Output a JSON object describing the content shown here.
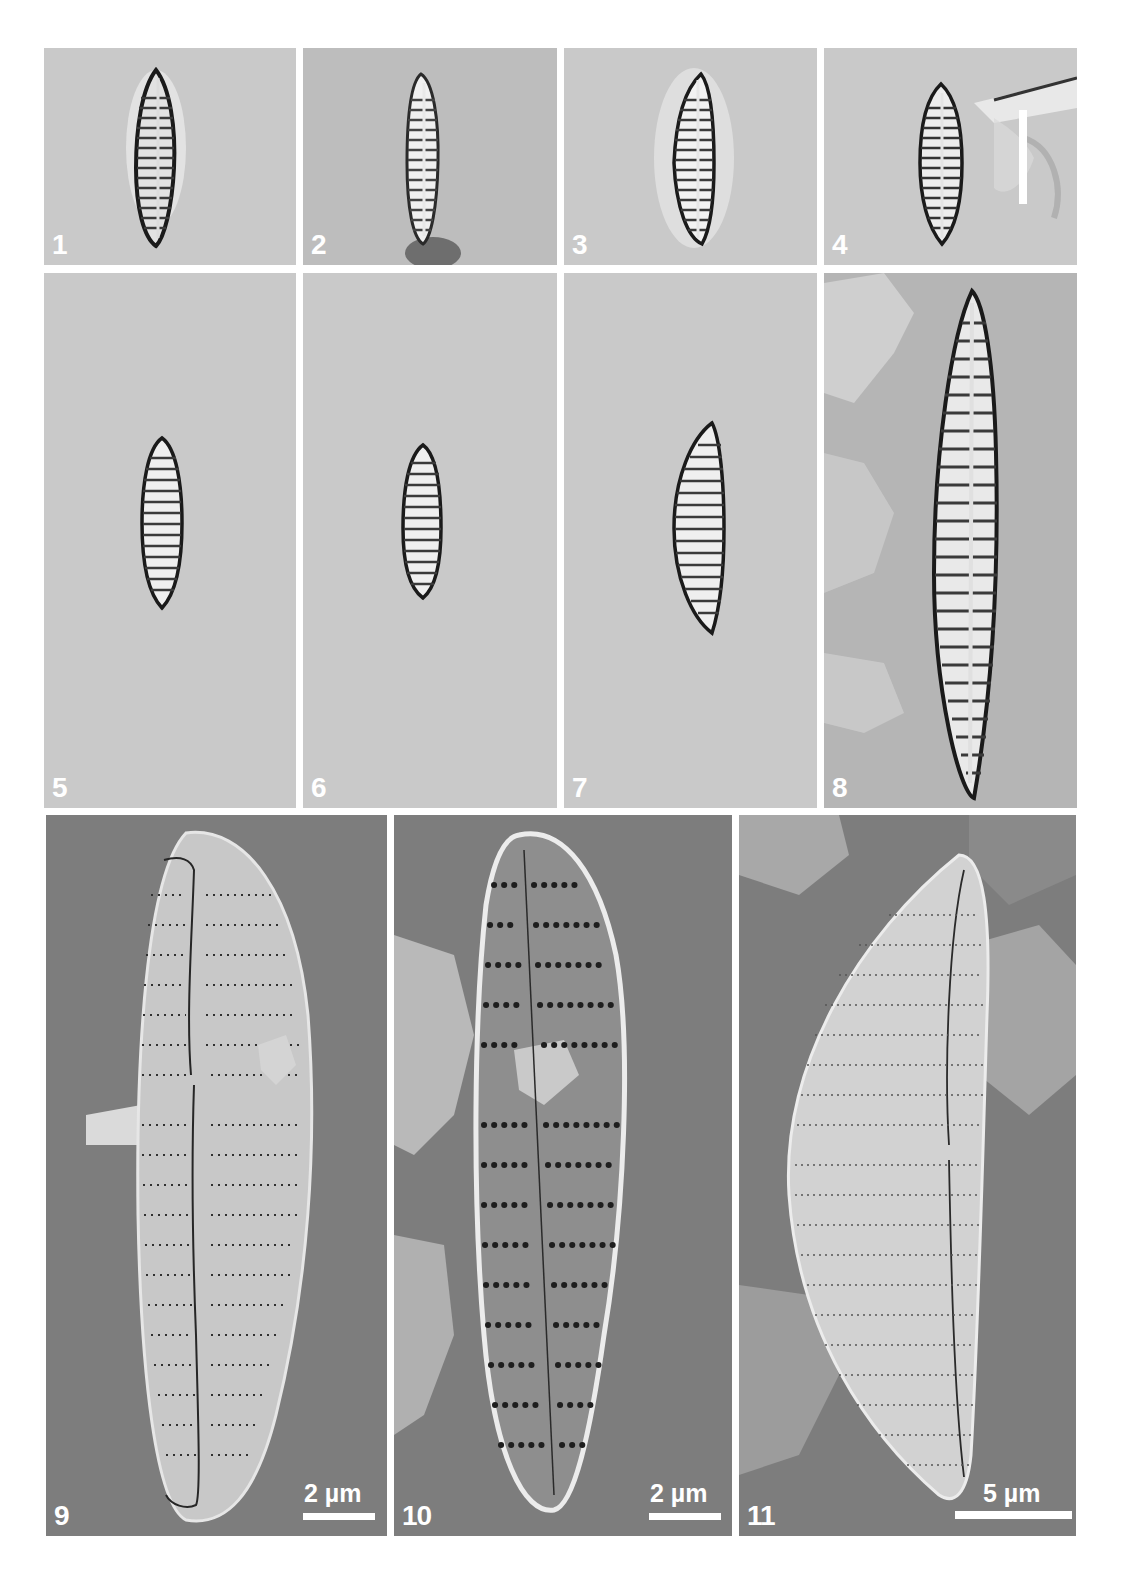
{
  "figure": {
    "type": "diatom micrograph plate",
    "rows": 3,
    "panels": [
      {
        "label": "1",
        "imaging": "LM",
        "view": "valve, lanceolate, striate"
      },
      {
        "label": "2",
        "imaging": "LM",
        "view": "valve, lanceolate, striate"
      },
      {
        "label": "3",
        "imaging": "LM",
        "view": "valve, semi-lanceolate, striate"
      },
      {
        "label": "4",
        "imaging": "LM",
        "view": "valve, lanceolate, with vertical scale bar"
      },
      {
        "label": "5",
        "imaging": "LM",
        "view": "small valve, lanceolate"
      },
      {
        "label": "6",
        "imaging": "LM",
        "view": "small valve, lanceolate"
      },
      {
        "label": "7",
        "imaging": "LM",
        "view": "valve, semi-lanceolate"
      },
      {
        "label": "8",
        "imaging": "LM",
        "view": "large valve, narrowly lanceolate"
      },
      {
        "label": "9",
        "imaging": "SEM",
        "view": "external valve view"
      },
      {
        "label": "10",
        "imaging": "SEM",
        "view": "internal valve view"
      },
      {
        "label": "11",
        "imaging": "SEM",
        "view": "external valve view, tilted"
      }
    ],
    "scale_bars": {
      "panel4": "",
      "panel9": "2 µm",
      "panel10": "2 µm",
      "panel11": "5 µm"
    }
  }
}
